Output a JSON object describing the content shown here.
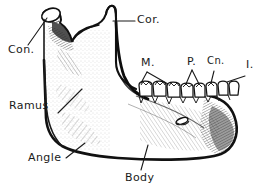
{
  "figure": {
    "style": "pen-and-ink line engraving with stipple and hatch shading",
    "background_color": "#ffffff",
    "ink_color": "#1a1a1a",
    "canvas": {
      "width": 266,
      "height": 195
    }
  },
  "labels": {
    "condyle": {
      "text": "Con.",
      "x": 8,
      "y": 48,
      "target": "condylar process (articular head)"
    },
    "coronoid": {
      "text": "Cor.",
      "x": 137,
      "y": 17,
      "target": "coronoid process"
    },
    "molars": {
      "text": "M.",
      "x": 141,
      "y": 61,
      "target": "molar teeth"
    },
    "premolars": {
      "text": "P.",
      "x": 187,
      "y": 61,
      "target": "premolar teeth"
    },
    "canine": {
      "text": "Cn.",
      "x": 208,
      "y": 60,
      "target": "canine tooth"
    },
    "incisors": {
      "text": "I.",
      "x": 246,
      "y": 63,
      "target": "incisor teeth"
    },
    "ramus": {
      "text": "Ramus",
      "x": 10,
      "y": 104,
      "target": "ramus of mandible"
    },
    "angle": {
      "text": "Angle",
      "x": 30,
      "y": 157,
      "target": "angle of mandible"
    },
    "body": {
      "text": "Body",
      "x": 126,
      "y": 176,
      "target": "body of mandible"
    }
  },
  "anatomy": {
    "teeth_count_visible": 8,
    "features": [
      "condylar process",
      "sigmoid (mandibular) notch",
      "coronoid process",
      "ramus",
      "angle",
      "body",
      "mental foramen",
      "alveolar margin with tooth row",
      "mental protuberance (chin)"
    ]
  }
}
